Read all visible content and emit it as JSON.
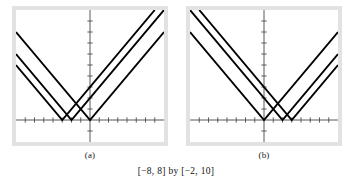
{
  "figure": {
    "caption": "[−8, 8] by [−2, 10]",
    "panel_a_label": "(a)",
    "panel_b_label": "(b)",
    "line_color": "#000000",
    "axis_color": "#595959",
    "frame_color": "#e2e2e2",
    "background_color": "#ffffff"
  },
  "chart_data": [
    {
      "type": "line",
      "title": "(a)",
      "xlabel": "",
      "ylabel": "",
      "xlim": [
        -8,
        8
      ],
      "ylim": [
        -2,
        10
      ],
      "grid": false,
      "legend": "none",
      "xticks": [
        -7,
        -6,
        -5,
        -4,
        -3,
        -2,
        -1,
        1,
        2,
        3,
        4,
        5,
        6,
        7
      ],
      "yticks": [
        -1,
        1,
        2,
        3,
        4,
        5,
        6,
        7,
        8,
        9
      ],
      "tick_step": 1,
      "series": [
        {
          "name": "y = |x + 3|",
          "vertex": [
            -3,
            0
          ],
          "slope": 1,
          "x": [
            -8,
            -3,
            8
          ],
          "values": [
            5,
            0,
            11
          ]
        },
        {
          "name": "y = |x + 2|",
          "vertex": [
            -2,
            0
          ],
          "slope": 1,
          "x": [
            -8,
            -2,
            8
          ],
          "values": [
            6,
            0,
            10
          ]
        },
        {
          "name": "y = |x|",
          "vertex": [
            0,
            0
          ],
          "slope": 1,
          "x": [
            -8,
            0,
            8
          ],
          "values": [
            8,
            0,
            8
          ]
        }
      ]
    },
    {
      "type": "line",
      "title": "(b)",
      "xlabel": "",
      "ylabel": "",
      "xlim": [
        -8,
        8
      ],
      "ylim": [
        -2,
        10
      ],
      "grid": false,
      "legend": "none",
      "xticks": [
        -7,
        -6,
        -5,
        -4,
        -3,
        -2,
        -1,
        1,
        2,
        3,
        4,
        5,
        6,
        7
      ],
      "yticks": [
        -1,
        1,
        2,
        3,
        4,
        5,
        6,
        7,
        8,
        9
      ],
      "tick_step": 1,
      "series": [
        {
          "name": "y = |x|",
          "vertex": [
            0,
            0
          ],
          "slope": 1,
          "x": [
            -8,
            0,
            8
          ],
          "values": [
            8,
            0,
            8
          ]
        },
        {
          "name": "y = |x - 2|",
          "vertex": [
            2,
            0
          ],
          "slope": 1,
          "x": [
            -8,
            2,
            8
          ],
          "values": [
            10,
            0,
            6
          ]
        },
        {
          "name": "y = |x - 3|",
          "vertex": [
            3,
            0
          ],
          "slope": 1,
          "x": [
            -8,
            3,
            8
          ],
          "values": [
            11,
            0,
            5
          ]
        }
      ]
    }
  ]
}
